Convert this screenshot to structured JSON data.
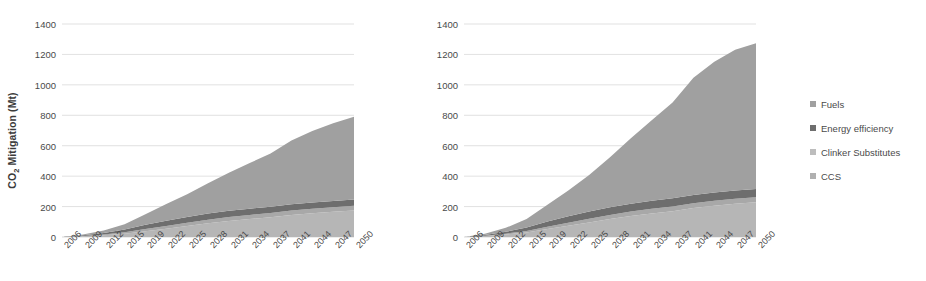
{
  "chart_data": [
    {
      "id": "left",
      "type": "area",
      "title": "",
      "xlabel": "",
      "ylabel": "CO2 Mitigation (Mt)",
      "ylabel_html": "CO<sub>2</sub> Mitigation (Mt)",
      "ylim": [
        0,
        1400
      ],
      "yticks": [
        0,
        200,
        400,
        600,
        800,
        1000,
        1200,
        1400
      ],
      "grid": true,
      "stacked": true,
      "x": [
        2006,
        2009,
        2012,
        2015,
        2019,
        2022,
        2025,
        2028,
        2031,
        2034,
        2037,
        2041,
        2044,
        2047,
        2050
      ],
      "categories": [
        "2006",
        "2009",
        "2012",
        "2015",
        "2019",
        "2022",
        "2025",
        "2028",
        "2031",
        "2034",
        "2037",
        "2041",
        "2044",
        "2047",
        "2050"
      ],
      "series": [
        {
          "name": "CCS",
          "color": "#b6b6b6",
          "values": [
            0,
            5,
            12,
            22,
            38,
            55,
            72,
            90,
            105,
            118,
            130,
            145,
            156,
            166,
            175
          ]
        },
        {
          "name": "Clinker Substitutes",
          "color": "#a8a8a8",
          "values": [
            0,
            2,
            5,
            9,
            14,
            18,
            21,
            24,
            26,
            27,
            28,
            29,
            30,
            30,
            31
          ]
        },
        {
          "name": "Energy efficiency",
          "color": "#6e6e6e",
          "values": [
            0,
            4,
            10,
            18,
            28,
            34,
            38,
            40,
            41,
            41,
            41,
            41,
            41,
            41,
            41
          ]
        },
        {
          "name": "Fuels",
          "color": "#a0a0a0",
          "values": [
            0,
            5,
            16,
            34,
            70,
            110,
            150,
            200,
            250,
            300,
            350,
            420,
            470,
            510,
            543
          ]
        }
      ],
      "totals": [
        0,
        16,
        43,
        83,
        150,
        217,
        281,
        354,
        422,
        486,
        549,
        635,
        697,
        747,
        790
      ]
    },
    {
      "id": "right",
      "type": "area",
      "title": "",
      "xlabel": "",
      "ylabel": "",
      "ylim": [
        0,
        1400
      ],
      "yticks": [
        0,
        200,
        400,
        600,
        800,
        1000,
        1200,
        1400
      ],
      "grid": true,
      "stacked": true,
      "x": [
        2006,
        2009,
        2012,
        2015,
        2019,
        2022,
        2025,
        2028,
        2031,
        2034,
        2037,
        2041,
        2044,
        2047,
        2050
      ],
      "categories": [
        "2006",
        "2009",
        "2012",
        "2015",
        "2019",
        "2022",
        "2025",
        "2028",
        "2031",
        "2034",
        "2037",
        "2041",
        "2044",
        "2047",
        "2050"
      ],
      "series": [
        {
          "name": "CCS",
          "color": "#b6b6b6",
          "values": [
            0,
            6,
            16,
            30,
            52,
            74,
            96,
            118,
            138,
            155,
            170,
            190,
            205,
            218,
            228
          ]
        },
        {
          "name": "Clinker Substitutes",
          "color": "#a8a8a8",
          "values": [
            0,
            2,
            6,
            10,
            16,
            20,
            24,
            27,
            29,
            30,
            31,
            32,
            33,
            33,
            34
          ]
        },
        {
          "name": "Energy efficiency",
          "color": "#6e6e6e",
          "values": [
            0,
            5,
            12,
            22,
            34,
            42,
            47,
            50,
            52,
            53,
            53,
            54,
            54,
            54,
            54
          ]
        },
        {
          "name": "Fuels",
          "color": "#a0a0a0",
          "values": [
            0,
            8,
            26,
            56,
            110,
            170,
            240,
            330,
            430,
            530,
            630,
            770,
            860,
            925,
            958
          ]
        }
      ],
      "totals": [
        0,
        21,
        60,
        118,
        212,
        306,
        407,
        525,
        649,
        768,
        884,
        1046,
        1152,
        1230,
        1274
      ]
    }
  ],
  "legend": {
    "position": "right",
    "items": [
      {
        "label": "Fuels",
        "color": "#a0a0a0"
      },
      {
        "label": "Energy efficiency",
        "color": "#6e6e6e"
      },
      {
        "label": "Clinker Substitutes",
        "color": "#bdbdbd"
      },
      {
        "label": "CCS",
        "color": "#b0b0b0"
      }
    ]
  },
  "style": {
    "background": "#ffffff",
    "grid_color": "#d9d9d9",
    "axis_text_color": "#4a4a4a",
    "ylabel_color": "#3b3b3b"
  }
}
